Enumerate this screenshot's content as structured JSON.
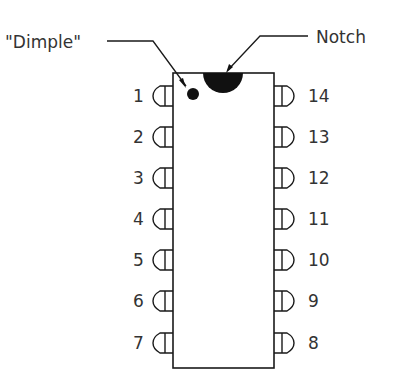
{
  "diagram": {
    "labels": {
      "dimple": "\"Dimple\"",
      "notch": "Notch"
    },
    "left_pins": [
      {
        "number": "1",
        "y": 96
      },
      {
        "number": "2",
        "y": 137
      },
      {
        "number": "3",
        "y": 178
      },
      {
        "number": "4",
        "y": 219
      },
      {
        "number": "5",
        "y": 260
      },
      {
        "number": "6",
        "y": 301
      },
      {
        "number": "7",
        "y": 343
      }
    ],
    "right_pins": [
      {
        "number": "14",
        "y": 96
      },
      {
        "number": "13",
        "y": 137
      },
      {
        "number": "12",
        "y": 178
      },
      {
        "number": "11",
        "y": 219
      },
      {
        "number": "10",
        "y": 260
      },
      {
        "number": "9",
        "y": 301
      },
      {
        "number": "8",
        "y": 343
      }
    ],
    "colors": {
      "line": "#1a1a1a",
      "text": "#333333",
      "fill": "#111111"
    }
  }
}
